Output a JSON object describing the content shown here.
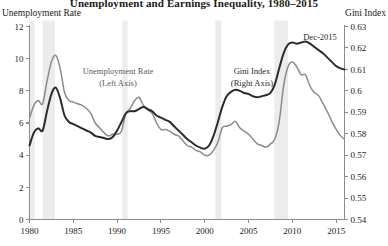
{
  "header": {
    "title": "Unemployment and Earnings Inequality, 1980–2015",
    "left_axis_title": "Unemployment Rate",
    "right_axis_title": "Gini Index"
  },
  "annotations": {
    "unemployment_line1": "Unemployment Rate",
    "unemployment_line2": "(Left Axis)",
    "gini_line1": "Gini Index",
    "gini_line2": "(Right Axis)",
    "last_point": "Dec-2015"
  },
  "colors": {
    "gini_line": "#2b2b2b",
    "unemployment_line": "#8a8a8a",
    "recession_band": "#ececec",
    "axis": "#8c8c8c",
    "text": "#1a1a1a"
  },
  "chart_data": {
    "type": "line",
    "title": "Unemployment and Earnings Inequality, 1980–2015",
    "xlabel": "",
    "ylabel": "Unemployment Rate",
    "y2label": "Gini Index",
    "xlim": [
      1980,
      2015.95
    ],
    "ylim": [
      0,
      12
    ],
    "y2lim": [
      0.54,
      0.63
    ],
    "xticks": [
      1980,
      1985,
      1990,
      1995,
      2000,
      2005,
      2010,
      2015
    ],
    "yticks": [
      0,
      2,
      4,
      6,
      8,
      10,
      12
    ],
    "y2ticks": [
      0.54,
      0.55,
      0.56,
      0.57,
      0.58,
      0.59,
      0.6,
      0.61,
      0.62,
      0.63
    ],
    "grid": false,
    "legend": "inline-annotations",
    "recession_bands": [
      {
        "start": 1980.0,
        "end": 1980.6
      },
      {
        "start": 1981.5,
        "end": 1982.9
      },
      {
        "start": 1990.6,
        "end": 1991.2
      },
      {
        "start": 2001.2,
        "end": 2001.9
      },
      {
        "start": 2007.95,
        "end": 2009.5
      }
    ],
    "series": [
      {
        "name": "Unemployment Rate",
        "axis": "left",
        "color": "#8a8a8a",
        "x": [
          1980.0,
          1980.5,
          1981.0,
          1981.5,
          1982.0,
          1982.5,
          1983.0,
          1983.5,
          1984.0,
          1984.5,
          1985.0,
          1985.5,
          1986.0,
          1986.5,
          1987.0,
          1987.5,
          1988.0,
          1988.5,
          1989.0,
          1989.5,
          1990.0,
          1990.5,
          1991.0,
          1991.5,
          1992.0,
          1992.5,
          1993.0,
          1993.5,
          1994.0,
          1994.5,
          1995.0,
          1995.5,
          1996.0,
          1996.5,
          1997.0,
          1997.5,
          1998.0,
          1998.5,
          1999.0,
          1999.5,
          2000.0,
          2000.5,
          2001.0,
          2001.5,
          2002.0,
          2002.5,
          2003.0,
          2003.5,
          2004.0,
          2004.5,
          2005.0,
          2005.5,
          2006.0,
          2006.5,
          2007.0,
          2007.5,
          2008.0,
          2008.5,
          2009.0,
          2009.5,
          2010.0,
          2010.5,
          2011.0,
          2011.5,
          2012.0,
          2012.5,
          2013.0,
          2013.5,
          2014.0,
          2014.5,
          2015.0,
          2015.5,
          2015.95
        ],
        "y": [
          6.3,
          7.1,
          7.4,
          7.2,
          8.6,
          9.8,
          10.2,
          9.4,
          7.9,
          7.4,
          7.3,
          7.2,
          7.1,
          6.9,
          6.6,
          6.0,
          5.7,
          5.4,
          5.2,
          5.3,
          5.3,
          5.5,
          6.6,
          6.9,
          7.4,
          7.6,
          7.1,
          6.8,
          6.6,
          6.0,
          5.6,
          5.6,
          5.5,
          5.3,
          5.2,
          4.9,
          4.6,
          4.5,
          4.3,
          4.2,
          4.0,
          4.0,
          4.3,
          4.8,
          5.7,
          5.8,
          5.9,
          6.1,
          5.7,
          5.5,
          5.3,
          5.0,
          4.7,
          4.6,
          4.5,
          4.7,
          5.0,
          6.1,
          8.3,
          9.5,
          9.8,
          9.5,
          9.0,
          9.0,
          8.3,
          7.9,
          7.7,
          7.2,
          6.7,
          6.1,
          5.6,
          5.2,
          5.0
        ]
      },
      {
        "name": "Gini Index",
        "axis": "right",
        "color": "#2b2b2b",
        "x": [
          1980.0,
          1980.5,
          1981.0,
          1981.5,
          1982.0,
          1982.5,
          1983.0,
          1983.5,
          1984.0,
          1984.5,
          1985.0,
          1985.5,
          1986.0,
          1986.5,
          1987.0,
          1987.5,
          1988.0,
          1988.5,
          1989.0,
          1989.5,
          1990.0,
          1990.5,
          1991.0,
          1991.5,
          1992.0,
          1992.5,
          1993.0,
          1993.5,
          1994.0,
          1994.5,
          1995.0,
          1995.5,
          1996.0,
          1996.5,
          1997.0,
          1997.5,
          1998.0,
          1998.5,
          1999.0,
          1999.5,
          2000.0,
          2000.5,
          2001.0,
          2001.5,
          2002.0,
          2002.5,
          2003.0,
          2003.5,
          2004.0,
          2004.5,
          2005.0,
          2005.5,
          2006.0,
          2006.5,
          2007.0,
          2007.5,
          2008.0,
          2008.5,
          2009.0,
          2009.5,
          2010.0,
          2010.5,
          2011.0,
          2011.5,
          2012.0,
          2012.5,
          2013.0,
          2013.5,
          2014.0,
          2014.5,
          2015.0,
          2015.5,
          2015.95
        ],
        "y": [
          0.5745,
          0.5805,
          0.5825,
          0.5815,
          0.5905,
          0.5985,
          0.6015,
          0.5965,
          0.5885,
          0.5855,
          0.5845,
          0.5835,
          0.5825,
          0.5815,
          0.5805,
          0.579,
          0.5785,
          0.578,
          0.5775,
          0.5785,
          0.5815,
          0.5855,
          0.5895,
          0.5905,
          0.5905,
          0.5915,
          0.5925,
          0.5915,
          0.5905,
          0.5885,
          0.5875,
          0.5865,
          0.5855,
          0.5835,
          0.5815,
          0.5795,
          0.5775,
          0.576,
          0.5745,
          0.5735,
          0.573,
          0.5745,
          0.579,
          0.5855,
          0.5925,
          0.5975,
          0.5995,
          0.6005,
          0.6,
          0.599,
          0.5985,
          0.5975,
          0.597,
          0.5975,
          0.598,
          0.599,
          0.603,
          0.6105,
          0.6175,
          0.6215,
          0.6225,
          0.622,
          0.6225,
          0.623,
          0.622,
          0.6205,
          0.619,
          0.6175,
          0.6155,
          0.6135,
          0.6115,
          0.6105,
          0.61
        ]
      }
    ]
  }
}
